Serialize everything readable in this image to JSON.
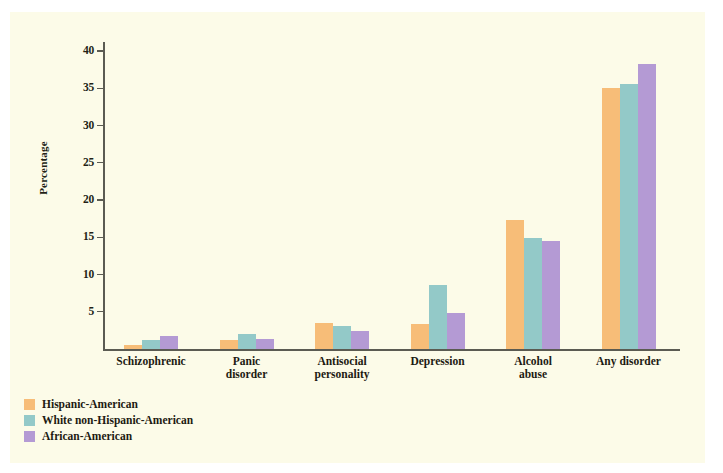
{
  "chart_data": {
    "type": "bar",
    "title": "",
    "xlabel": "",
    "ylabel": "Percentage",
    "ylim": [
      0,
      41
    ],
    "yticks": [
      5,
      10,
      15,
      20,
      25,
      30,
      35,
      40
    ],
    "grid": false,
    "legend_position": "bottom-left",
    "categories": [
      "Schizophrenic",
      "Panic disorder",
      "Antisocial personality",
      "Depression",
      "Alcohol abuse",
      "Any disorder"
    ],
    "category_lines": [
      [
        "Schizophrenic"
      ],
      [
        "Panic",
        "disorder"
      ],
      [
        "Antisocial",
        "personality"
      ],
      [
        "Depression"
      ],
      [
        "Alcohol",
        "abuse"
      ],
      [
        "Any disorder"
      ]
    ],
    "series": [
      {
        "name": "Hispanic-American",
        "color": "#f7bd78",
        "values": [
          0.5,
          1.2,
          3.5,
          3.4,
          17.3,
          35.0
        ]
      },
      {
        "name": "White non-Hispanic-American",
        "color": "#93c9c8",
        "values": [
          1.2,
          2.0,
          3.1,
          8.6,
          14.9,
          35.6
        ]
      },
      {
        "name": "African-American",
        "color": "#b49ad4",
        "values": [
          1.8,
          1.3,
          2.4,
          4.9,
          14.5,
          38.2
        ]
      }
    ]
  },
  "colors": {
    "background": "#fcfbe8",
    "axis": "#5b5b52",
    "text": "#1d1a12",
    "series_1": "#f7bd78",
    "series_2": "#93c9c8",
    "series_3": "#b49ad4"
  }
}
